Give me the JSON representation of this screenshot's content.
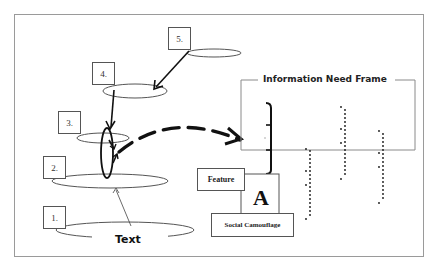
{
  "diagram": {
    "levels": [
      {
        "number": "1.",
        "box": {
          "x": 43,
          "y": 206
        }
      },
      {
        "number": "2.",
        "box": {
          "x": 43,
          "y": 156
        }
      },
      {
        "number": "3.",
        "box": {
          "x": 58,
          "y": 112
        }
      },
      {
        "number": "4.",
        "box": {
          "x": 92,
          "y": 62
        }
      },
      {
        "number": "5.",
        "box": {
          "x": 168,
          "y": 28
        }
      }
    ],
    "base_label": "Text",
    "frame": {
      "title": "Information Need Frame"
    },
    "feature_label": "Feature",
    "feature_letter": "A",
    "social_label": "Social Camouflage",
    "colors": {
      "stroke": "#111111",
      "frame_border": "#8a8a8a",
      "thin_line": "#555555",
      "background": "#ffffff"
    }
  }
}
